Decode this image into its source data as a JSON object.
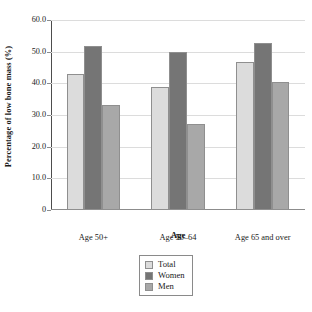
{
  "chart_data": {
    "type": "bar",
    "title": "",
    "xlabel": "Age",
    "ylabel": "Percentage of low bone mass (%)",
    "categories": [
      "Age 50+",
      "Age 50–64",
      "Age 65 and over"
    ],
    "series": [
      {
        "name": "Total",
        "values": [
          43.0,
          39.0,
          46.8
        ],
        "color": "#dcdcdc"
      },
      {
        "name": "Women",
        "values": [
          51.8,
          50.0,
          52.8
        ],
        "color": "#757575"
      },
      {
        "name": "Men",
        "values": [
          33.2,
          27.2,
          40.5
        ],
        "color": "#a8a8a8"
      }
    ],
    "ylim": [
      0,
      60
    ],
    "yticks": [
      "0",
      "10.0",
      "20.0",
      "30.0",
      "40.0",
      "50.0",
      "60.0"
    ],
    "ytick_values": [
      0,
      10,
      20,
      30,
      40,
      50,
      60
    ],
    "grid": true,
    "legend_position": "bottom-center",
    "legend_entries": [
      "Total",
      "Women",
      "Men"
    ]
  }
}
